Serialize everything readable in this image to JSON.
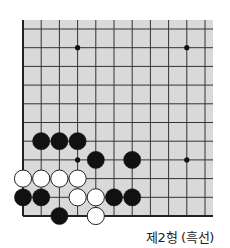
{
  "diagram": {
    "type": "go-board-fragment",
    "caption": "제2형 (흑선)",
    "colors": {
      "board": "#d9d9d9",
      "line": "#333333",
      "border": "#222222",
      "black_stone": "#111111",
      "white_stone": "#ffffff",
      "white_outline": "#222222"
    },
    "grid": {
      "origin_x": 23,
      "origin_y": 29,
      "spacing_x": 18.2,
      "spacing_y": 18.7,
      "cols": 11,
      "rows": 11,
      "board_left": 23,
      "board_top": 20,
      "board_right": 213,
      "board_bottom": 216,
      "left_edge": true,
      "bottom_edge": true
    },
    "star_points": [
      {
        "col": 3,
        "row": 1
      },
      {
        "col": 9,
        "row": 1
      },
      {
        "col": 3,
        "row": 7
      },
      {
        "col": 9,
        "row": 7
      }
    ],
    "stones": [
      {
        "color": "black",
        "col": 1,
        "row": 6
      },
      {
        "color": "black",
        "col": 2,
        "row": 6
      },
      {
        "color": "black",
        "col": 3,
        "row": 6
      },
      {
        "color": "black",
        "col": 4,
        "row": 7
      },
      {
        "color": "black",
        "col": 6,
        "row": 7
      },
      {
        "color": "white",
        "col": 0,
        "row": 8
      },
      {
        "color": "white",
        "col": 1,
        "row": 8
      },
      {
        "color": "white",
        "col": 2,
        "row": 8
      },
      {
        "color": "white",
        "col": 3,
        "row": 8
      },
      {
        "color": "black",
        "col": 0,
        "row": 9
      },
      {
        "color": "black",
        "col": 1,
        "row": 9
      },
      {
        "color": "white",
        "col": 3,
        "row": 9
      },
      {
        "color": "white",
        "col": 4,
        "row": 9
      },
      {
        "color": "black",
        "col": 5,
        "row": 9
      },
      {
        "color": "black",
        "col": 6,
        "row": 9
      },
      {
        "color": "black",
        "col": 2,
        "row": 10
      },
      {
        "color": "white",
        "col": 4,
        "row": 10
      }
    ]
  }
}
